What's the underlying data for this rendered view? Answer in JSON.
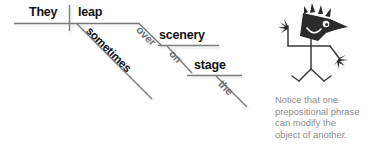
{
  "figure": {
    "type": "sentence-diagram",
    "sentence": "They leap sometimes over scenery on stage the",
    "caption": {
      "lines": [
        "Notice that one",
        "prepositional phrase",
        "can modify the",
        "object of another."
      ],
      "color": "#8c8c8c"
    },
    "colors": {
      "baseline": "#7a7a7a",
      "text_dark": "#111111",
      "text_gray": "#6f6f6f",
      "mascot": "#2b2b2b",
      "background": "#ffffff"
    },
    "words": [
      {
        "id": "subject",
        "text": "They",
        "role": "subject",
        "style": "dark",
        "angle": 0
      },
      {
        "id": "verb",
        "text": "leap",
        "role": "verb",
        "style": "dark",
        "angle": 0
      },
      {
        "id": "adverb",
        "text": "sometimes",
        "role": "adverb-modifier",
        "style": "dark",
        "angle": 45
      },
      {
        "id": "prep1",
        "text": "over",
        "role": "preposition",
        "style": "gray",
        "angle": 45
      },
      {
        "id": "object1",
        "text": "scenery",
        "role": "object-of-prep",
        "style": "dark",
        "angle": 0
      },
      {
        "id": "prep2",
        "text": "on",
        "role": "preposition",
        "style": "gray",
        "angle": 45
      },
      {
        "id": "object2",
        "text": "stage",
        "role": "object-of-prep",
        "style": "dark",
        "angle": 0
      },
      {
        "id": "article",
        "text": "the",
        "role": "article-modifier",
        "style": "gray",
        "angle": 45
      }
    ],
    "mascot": {
      "name": "spiky-haired-cartoon-figure",
      "alt": "cartoon stick figure with spiky hair waving"
    }
  }
}
